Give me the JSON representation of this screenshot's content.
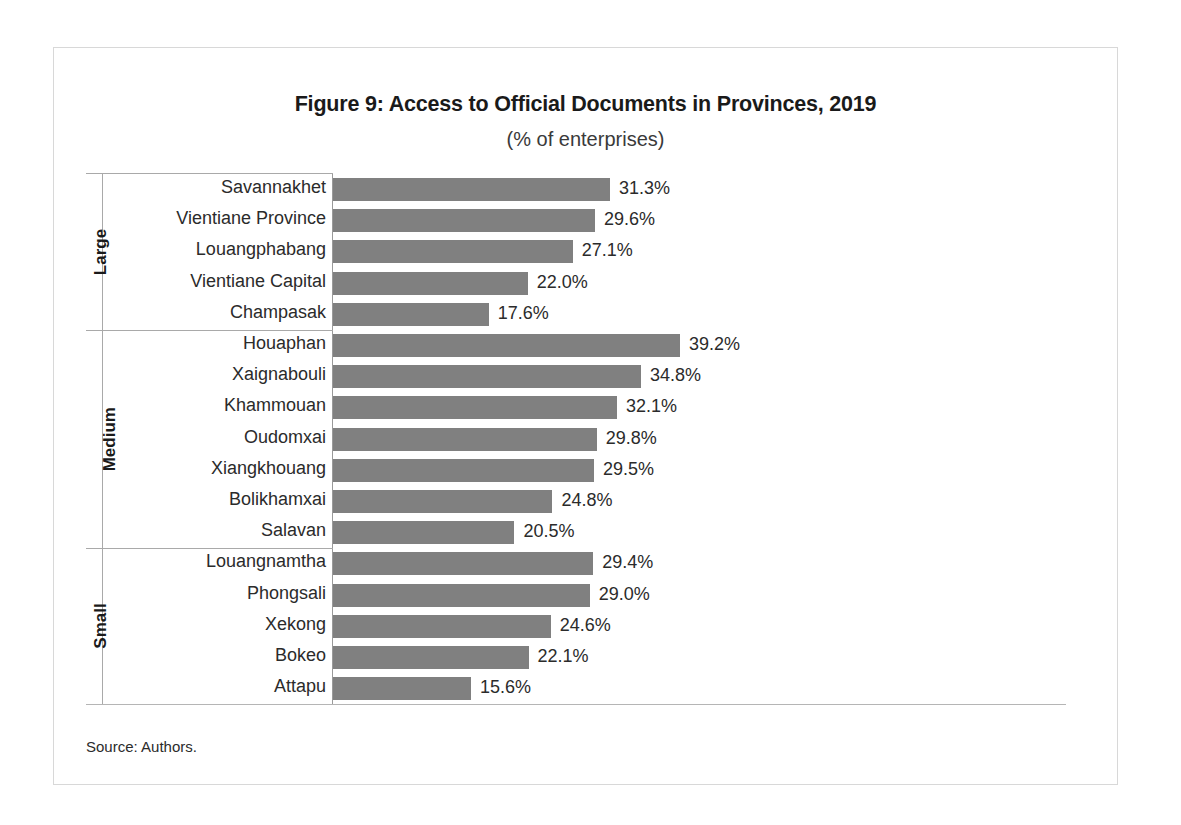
{
  "figure": {
    "title": "Figure 9: Access to Official Documents in Provinces, 2019",
    "subtitle": "(% of enterprises)",
    "source": "Source: Authors."
  },
  "chart_data": {
    "type": "bar",
    "orientation": "horizontal",
    "title": "Figure 9: Access to Official Documents in Provinces, 2019",
    "subtitle": "(% of enterprises)",
    "xlabel": "",
    "ylabel": "",
    "xlim": [
      0,
      39.2
    ],
    "grid": false,
    "legend": "none",
    "bar_color": "#808080",
    "value_suffix": "%",
    "groups": [
      {
        "name": "Large",
        "categories": [
          "Savannakhet",
          "Vientiane Province",
          "Louangphabang",
          "Vientiane Capital",
          "Champasak"
        ],
        "values": [
          31.3,
          29.6,
          27.1,
          22.0,
          17.6
        ],
        "labels": [
          "31.3%",
          "29.6%",
          "27.1%",
          "22.0%",
          "17.6%"
        ]
      },
      {
        "name": "Medium",
        "categories": [
          "Houaphan",
          "Xaignabouli",
          "Khammouan",
          "Oudomxai",
          "Xiangkhouang",
          "Bolikhamxai",
          "Salavan"
        ],
        "values": [
          39.2,
          34.8,
          32.1,
          29.8,
          29.5,
          24.8,
          20.5
        ],
        "labels": [
          "39.2%",
          "34.8%",
          "32.1%",
          "29.8%",
          "29.5%",
          "24.8%",
          "20.5%"
        ]
      },
      {
        "name": "Small",
        "categories": [
          "Louangnamtha",
          "Phongsali",
          "Xekong",
          "Bokeo",
          "Attapu"
        ],
        "values": [
          29.4,
          29.0,
          24.6,
          22.1,
          15.6
        ],
        "labels": [
          "29.4%",
          "29.0%",
          "24.6%",
          "22.1%",
          "15.6%"
        ]
      }
    ]
  }
}
